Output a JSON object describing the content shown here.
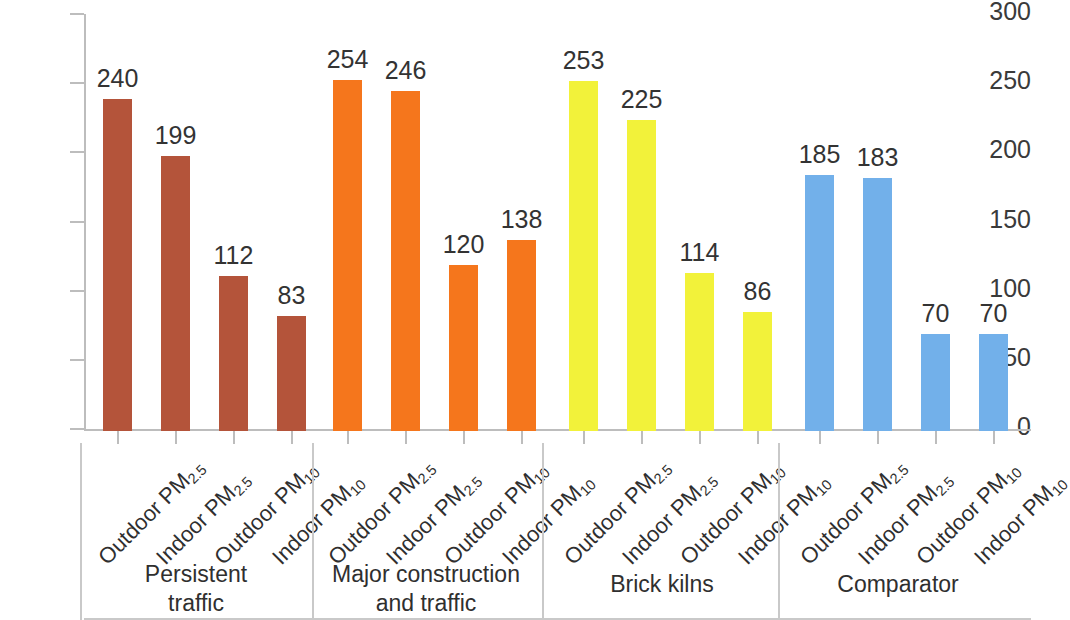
{
  "chart_data": {
    "type": "bar",
    "title": "",
    "xlabel": "",
    "ylabel": "",
    "ylim": [
      0,
      300
    ],
    "y_ticks": [
      0,
      50,
      100,
      150,
      200,
      250,
      300
    ],
    "grid": false,
    "legend": "none",
    "categories": [
      "Outdoor PM2.5",
      "Indoor PM2.5",
      "Outdoor PM10",
      "Indoor PM10",
      "Outdoor PM2.5",
      "Indoor PM2.5",
      "Outdoor PM10",
      "Indoor PM10",
      "Outdoor PM2.5",
      "Indoor PM2.5",
      "Outdoor PM10",
      "Indoor PM10",
      "Outdoor PM2.5",
      "Indoor PM2.5",
      "Outdoor PM10",
      "Indoor PM10"
    ],
    "values": [
      240,
      199,
      112,
      83,
      254,
      246,
      120,
      138,
      253,
      225,
      114,
      86,
      185,
      183,
      70,
      70
    ],
    "groups": [
      {
        "name": "Persistent traffic",
        "name_lines": [
          "Persistent",
          "traffic"
        ],
        "color": "#b4543a",
        "bars": [
          {
            "base": "Outdoor PM",
            "sub": "2.5",
            "value": 240,
            "label": "240"
          },
          {
            "base": "Indoor PM",
            "sub": "2.5",
            "value": 199,
            "label": "199"
          },
          {
            "base": "Outdoor PM",
            "sub": "10",
            "value": 112,
            "label": "112"
          },
          {
            "base": "Indoor PM",
            "sub": "10",
            "value": 83,
            "label": "83"
          }
        ]
      },
      {
        "name": "Major construction and traffic",
        "name_lines": [
          "Major construction",
          "and traffic"
        ],
        "color": "#f5761c",
        "bars": [
          {
            "base": "Outdoor PM",
            "sub": "2.5",
            "value": 254,
            "label": "254"
          },
          {
            "base": "Indoor PM",
            "sub": "2.5",
            "value": 246,
            "label": "246"
          },
          {
            "base": "Outdoor PM",
            "sub": "10",
            "value": 120,
            "label": "120"
          },
          {
            "base": "Indoor PM",
            "sub": "10",
            "value": 138,
            "label": "138"
          }
        ]
      },
      {
        "name": "Brick kilns",
        "name_lines": [
          "Brick kilns"
        ],
        "color": "#f2f23a",
        "bars": [
          {
            "base": "Outdoor PM",
            "sub": "2.5",
            "value": 253,
            "label": "253"
          },
          {
            "base": "Indoor PM",
            "sub": "2.5",
            "value": 225,
            "label": "225"
          },
          {
            "base": "Outdoor PM",
            "sub": "10",
            "value": 114,
            "label": "114"
          },
          {
            "base": "Indoor PM",
            "sub": "10",
            "value": 86,
            "label": "86"
          }
        ]
      },
      {
        "name": "Comparator",
        "name_lines": [
          "Comparator"
        ],
        "color": "#72b0ea",
        "bars": [
          {
            "base": "Outdoor PM",
            "sub": "2.5",
            "value": 185,
            "label": "185"
          },
          {
            "base": "Indoor PM",
            "sub": "2.5",
            "value": 183,
            "label": "183"
          },
          {
            "base": "Outdoor PM",
            "sub": "10",
            "value": 70,
            "label": "70"
          },
          {
            "base": "Indoor PM",
            "sub": "10",
            "value": 70,
            "label": "70"
          }
        ]
      }
    ]
  }
}
